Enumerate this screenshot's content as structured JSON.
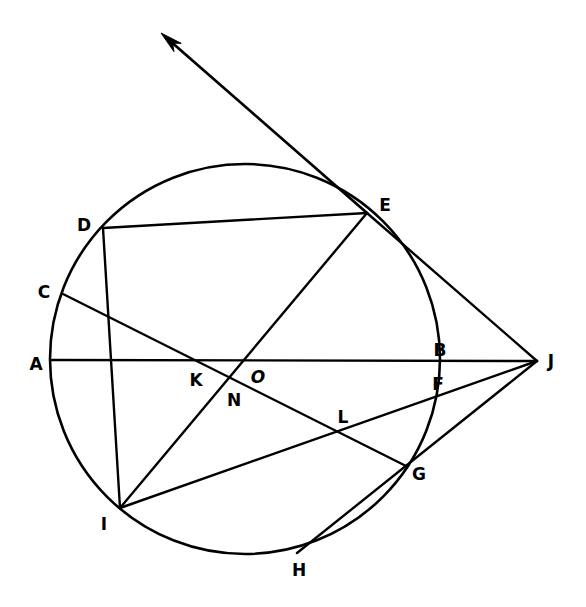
{
  "figure": {
    "background_color": "#ffffff",
    "stroke_color": "#000000",
    "width": 586,
    "height": 607
  },
  "circle": {
    "name": "main-circle",
    "center_x": 245,
    "center_y": 359,
    "radius": 195
  },
  "labels": [
    {
      "id": "A",
      "text": "A",
      "x": 36,
      "y": 364
    },
    {
      "id": "B",
      "text": "B",
      "x": 440,
      "y": 350
    },
    {
      "id": "C",
      "text": "C",
      "x": 44,
      "y": 292
    },
    {
      "id": "D",
      "text": "D",
      "x": 84,
      "y": 225
    },
    {
      "id": "E",
      "text": "E",
      "x": 385,
      "y": 205
    },
    {
      "id": "F",
      "text": "F",
      "x": 438,
      "y": 384
    },
    {
      "id": "G",
      "text": "G",
      "x": 419,
      "y": 474
    },
    {
      "id": "H",
      "text": "H",
      "x": 299,
      "y": 570
    },
    {
      "id": "I",
      "text": "I",
      "x": 104,
      "y": 524
    },
    {
      "id": "J",
      "text": "J",
      "x": 551,
      "y": 361
    },
    {
      "id": "K",
      "text": "K",
      "x": 196,
      "y": 380
    },
    {
      "id": "L",
      "text": "L",
      "x": 343,
      "y": 417
    },
    {
      "id": "N",
      "text": "N",
      "x": 234,
      "y": 400
    },
    {
      "id": "O",
      "text": "O",
      "x": 258,
      "y": 377
    }
  ],
  "points": {
    "A": {
      "x": 52,
      "y": 360
    },
    "B": {
      "x": 428,
      "y": 360
    },
    "C": {
      "x": 63,
      "y": 294
    },
    "D": {
      "x": 103,
      "y": 228
    },
    "E": {
      "x": 367,
      "y": 213
    },
    "F": {
      "x": 421,
      "y": 388
    },
    "G": {
      "x": 406,
      "y": 466
    },
    "H": {
      "x": 297,
      "y": 553
    },
    "I": {
      "x": 120,
      "y": 508
    },
    "J": {
      "x": 537,
      "y": 361
    },
    "K": {
      "x": 200,
      "y": 360
    },
    "L": {
      "x": 341,
      "y": 414
    },
    "N": {
      "x": 211,
      "y": 379
    },
    "O": {
      "x": 245,
      "y": 359
    },
    "ArrowTip": {
      "x": 161,
      "y": 33
    }
  },
  "segments": [
    {
      "id": "seg-A-J",
      "name": "segment-A-to-J-through-O-B",
      "from": "A",
      "to": "J"
    },
    {
      "id": "seg-D-E",
      "name": "segment-D-to-E",
      "from": "D",
      "to": "E"
    },
    {
      "id": "seg-D-N",
      "name": "segment-D-to-I-through-N",
      "from": "D",
      "to": "I"
    },
    {
      "id": "seg-C-G",
      "name": "segment-C-to-G-through-K-L",
      "from": "C",
      "to": "G"
    },
    {
      "id": "seg-E-I",
      "name": "segment-E-to-I-through-O",
      "from": "E",
      "to": "I"
    },
    {
      "id": "seg-E-J",
      "name": "segment-E-to-J",
      "from": "E",
      "to": "J"
    },
    {
      "id": "seg-H-J",
      "name": "segment-H-to-J-through-G",
      "from": "H",
      "to": "J"
    },
    {
      "id": "seg-I-J",
      "name": "segment-I-to-J-through-L-F",
      "from": "I",
      "to": "J"
    }
  ],
  "ray": {
    "id": "ray-E-arrow",
    "name": "tangent-ray-from-E",
    "from": "E",
    "to": "ArrowTip",
    "has_arrowhead": true
  }
}
